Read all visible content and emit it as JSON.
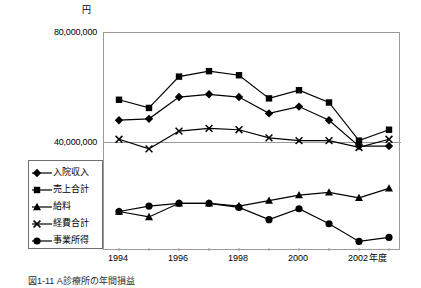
{
  "chart_data": {
    "type": "line",
    "title": "",
    "xlabel": "年度",
    "ylabel": "円",
    "x": [
      1994,
      1995,
      1996,
      1997,
      1998,
      1999,
      2000,
      2001,
      2002,
      2003
    ],
    "xtick_labels": [
      "1994",
      "",
      "1996",
      "",
      "1998",
      "",
      "2000",
      "",
      "2002",
      ""
    ],
    "ylim": [
      0,
      80000000
    ],
    "ytick_labels": [
      "80,000,000",
      "40,000,000"
    ],
    "ytick_values": [
      80000000,
      40000000
    ],
    "grid": true,
    "legend_position": "lower-left-outside",
    "series": [
      {
        "name": "入院収入",
        "marker": "diamond",
        "values": [
          48000000,
          48500000,
          56500000,
          57500000,
          56500000,
          50500000,
          53000000,
          48000000,
          38500000,
          38500000
        ]
      },
      {
        "name": "売上合計",
        "marker": "square",
        "values": [
          55500000,
          52500000,
          64000000,
          66000000,
          64500000,
          56000000,
          59000000,
          54500000,
          40500000,
          44500000
        ]
      },
      {
        "name": "給料",
        "marker": "triangle",
        "values": [
          14500000,
          12500000,
          17500000,
          17500000,
          16500000,
          18500000,
          20500000,
          21500000,
          19500000,
          23000000
        ]
      },
      {
        "name": "経費合計",
        "marker": "x",
        "values": [
          41000000,
          37500000,
          44000000,
          45000000,
          44500000,
          41500000,
          40500000,
          40500000,
          38000000,
          41000000
        ]
      },
      {
        "name": "事業所得",
        "marker": "circle",
        "values": [
          14500000,
          16500000,
          17500000,
          17500000,
          16000000,
          11500000,
          15500000,
          10000000,
          3500000,
          5000000
        ]
      }
    ]
  },
  "axis": {
    "unit_label": "円",
    "y_top_label": "80,000,000",
    "y_mid_label": "40,000,000",
    "x_title": "年度",
    "x_labels": [
      "1994",
      "1996",
      "1998",
      "2000",
      "2002"
    ]
  },
  "legend": {
    "items": [
      {
        "label": "入院収入",
        "marker": "diamond"
      },
      {
        "label": "売上合計",
        "marker": "square"
      },
      {
        "label": "給料",
        "marker": "triangle"
      },
      {
        "label": "経費合計",
        "marker": "x"
      },
      {
        "label": "事業所得",
        "marker": "circle"
      }
    ]
  },
  "caption": {
    "text": "図1-11 A診療所の年間損益"
  },
  "colors": {
    "line": "#000000",
    "frame": "#9a9a9a",
    "grid": "#9a9a9a"
  }
}
